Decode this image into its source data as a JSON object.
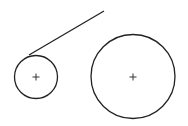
{
  "diagram": {
    "stroke_color": "#222222",
    "background": "#ffffff",
    "elements": [
      {
        "type": "circle",
        "name": "small-circle",
        "has_center_mark": true
      },
      {
        "type": "circle",
        "name": "large-circle",
        "has_center_mark": true
      },
      {
        "type": "line",
        "name": "tangent-line",
        "tangent_to": "small-circle"
      }
    ]
  }
}
